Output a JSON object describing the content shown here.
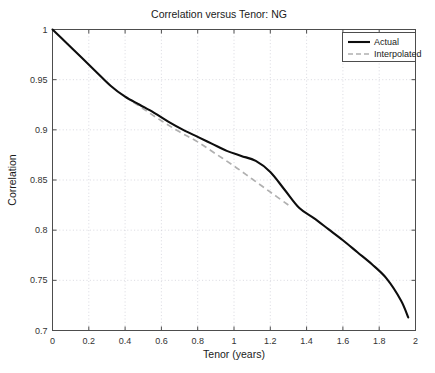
{
  "chart_data": {
    "type": "line",
    "title": "Correlation versus Tenor: NG",
    "xlabel": "Tenor (years)",
    "ylabel": "Correlation",
    "xlim": [
      0,
      2
    ],
    "ylim": [
      0.7,
      1
    ],
    "grid": true,
    "legend_position": "top-right",
    "xticks": [
      0,
      0.2,
      0.4,
      0.6,
      0.8,
      1,
      1.2,
      1.4,
      1.6,
      1.8,
      2
    ],
    "xticklabels": [
      "0",
      "0.2",
      "0.4",
      "0.6",
      "0.8",
      "1",
      "1.2",
      "1.4",
      "1.6",
      "1.8",
      "2"
    ],
    "yticks": [
      0.7,
      0.75,
      0.8,
      0.85,
      0.9,
      0.95,
      1
    ],
    "yticklabels": [
      "0.7",
      "0.75",
      "0.8",
      "0.85",
      "0.9",
      "0.95",
      "1"
    ],
    "series": [
      {
        "name": "Actual",
        "style": "solid",
        "color": "#0d0d0d",
        "x": [
          0,
          0.08,
          0.16,
          0.24,
          0.32,
          0.4,
          0.48,
          0.56,
          0.64,
          0.72,
          0.8,
          0.88,
          0.96,
          1.04,
          1.12,
          1.2,
          1.28,
          1.36,
          1.44,
          1.52,
          1.6,
          1.68,
          1.76,
          1.84,
          1.92,
          1.96
        ],
        "y": [
          1.0,
          0.986,
          0.972,
          0.958,
          0.944,
          0.933,
          0.925,
          0.917,
          0.908,
          0.9,
          0.893,
          0.886,
          0.879,
          0.874,
          0.869,
          0.858,
          0.84,
          0.822,
          0.812,
          0.801,
          0.79,
          0.778,
          0.766,
          0.752,
          0.73,
          0.713
        ]
      },
      {
        "name": "Interpolated",
        "style": "dashed",
        "color": "#b0b0b0",
        "x": [
          0.4,
          0.5,
          0.6,
          0.7,
          0.8,
          0.9,
          1.0,
          1.1,
          1.2,
          1.3
        ],
        "y": [
          0.933,
          0.921,
          0.909,
          0.898,
          0.888,
          0.876,
          0.864,
          0.851,
          0.838,
          0.825
        ]
      }
    ]
  },
  "legend": {
    "items": [
      {
        "label": "Actual"
      },
      {
        "label": "Interpolated"
      }
    ]
  }
}
